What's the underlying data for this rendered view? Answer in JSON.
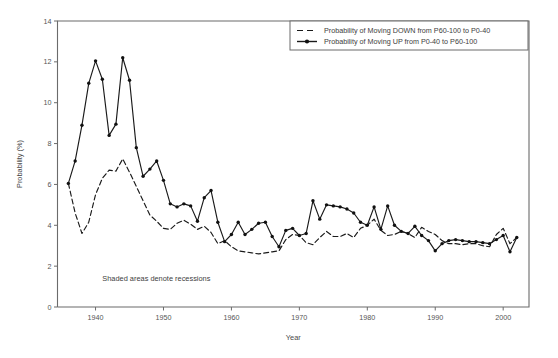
{
  "figure": {
    "annotation": "Shaded areas denote recessions",
    "background_color": "#ffffff",
    "line_color": "#1a1a1a",
    "axis_color": "#6b6b6b"
  },
  "legend": {
    "position": "top-right",
    "entries": [
      {
        "label": "Probability of Moving DOWN from P60-100 to P0-40",
        "style": "dashed",
        "marker": "none"
      },
      {
        "label": "Probability of Moving UP from P0-40 to P60-100",
        "style": "solid",
        "marker": "filled-circle"
      }
    ]
  },
  "chart_data": {
    "type": "line",
    "title": "",
    "subtitle": "",
    "xlabel": "Year",
    "ylabel": "Probability (%)",
    "xlim": [
      1934.4,
      2003.8
    ],
    "ylim": [
      0,
      14
    ],
    "xticks": [
      1940,
      1950,
      1960,
      1970,
      1980,
      1990,
      2000
    ],
    "yticks": [
      0,
      2,
      4,
      6,
      8,
      10,
      12,
      14
    ],
    "xticklabels": [
      "1940",
      "1950",
      "1960",
      "1970",
      "1980",
      "1990",
      "2000"
    ],
    "yticklabels": [
      "0",
      "2",
      "4",
      "6",
      "8",
      "10",
      "12",
      "14"
    ],
    "grid": false,
    "legend_position": "upper right",
    "annotations": [
      {
        "text": "Shaded areas denote recessions",
        "x": 1941.0,
        "y": 1.25
      }
    ],
    "x": [
      1936,
      1937,
      1938,
      1939,
      1940,
      1941,
      1942,
      1943,
      1944,
      1945,
      1946,
      1947,
      1948,
      1949,
      1950,
      1951,
      1952,
      1953,
      1954,
      1955,
      1956,
      1957,
      1958,
      1959,
      1960,
      1961,
      1962,
      1963,
      1964,
      1965,
      1966,
      1967,
      1968,
      1969,
      1970,
      1971,
      1972,
      1973,
      1974,
      1975,
      1976,
      1977,
      1978,
      1979,
      1980,
      1981,
      1982,
      1983,
      1984,
      1985,
      1986,
      1987,
      1988,
      1989,
      1990,
      1991,
      1992,
      1993,
      1994,
      1995,
      1996,
      1997,
      1998,
      1999,
      2000,
      2001,
      2002
    ],
    "series": [
      {
        "name": "Probability of Moving UP from P0-40 to P60-100",
        "style": "solid",
        "marker": "filled-circle",
        "values": [
          6.05,
          7.15,
          8.9,
          10.95,
          12.05,
          11.15,
          8.4,
          8.95,
          12.2,
          11.1,
          7.8,
          6.4,
          6.75,
          7.15,
          6.2,
          5.05,
          4.9,
          5.05,
          4.95,
          4.2,
          5.35,
          5.7,
          4.15,
          3.2,
          3.55,
          4.15,
          3.55,
          3.8,
          4.1,
          4.15,
          3.45,
          2.95,
          3.75,
          3.85,
          3.5,
          3.6,
          5.2,
          4.3,
          5.0,
          4.95,
          4.9,
          4.8,
          4.6,
          4.15,
          4.0,
          4.9,
          3.8,
          4.95,
          4.0,
          3.7,
          3.6,
          3.95,
          3.5,
          3.25,
          2.75,
          3.1,
          3.25,
          3.3,
          3.25,
          3.2,
          3.2,
          3.15,
          3.1,
          3.3,
          3.5,
          2.7,
          3.4
        ]
      },
      {
        "name": "Probability of Moving DOWN from P60-100 to P0-40",
        "style": "dashed",
        "marker": "none",
        "values": [
          6.05,
          4.6,
          3.6,
          4.15,
          5.5,
          6.3,
          6.7,
          6.65,
          7.25,
          6.6,
          5.9,
          5.2,
          4.5,
          4.2,
          3.85,
          3.8,
          4.1,
          4.25,
          4.05,
          3.8,
          3.95,
          3.65,
          3.1,
          3.25,
          2.95,
          2.75,
          2.7,
          2.65,
          2.6,
          2.65,
          2.7,
          2.75,
          3.3,
          3.55,
          3.5,
          3.15,
          3.05,
          3.4,
          3.7,
          3.45,
          3.45,
          3.6,
          3.4,
          3.85,
          4.0,
          4.3,
          3.75,
          3.5,
          3.55,
          3.7,
          3.6,
          3.4,
          3.9,
          3.7,
          3.55,
          3.25,
          3.1,
          3.1,
          3.05,
          3.1,
          3.1,
          3.0,
          2.95,
          3.55,
          3.85,
          3.1,
          3.4
        ]
      }
    ]
  }
}
